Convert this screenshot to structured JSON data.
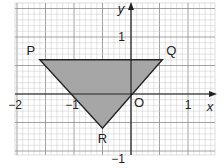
{
  "diagram": {
    "type": "coordinate-grid-triangle",
    "axes": {
      "x_label": "x",
      "y_label": "y",
      "origin_label": "O",
      "x_ticks": [
        {
          "value": -2,
          "label": "−2"
        },
        {
          "value": -1,
          "label": "−1"
        },
        {
          "value": 1,
          "label": "1"
        }
      ],
      "y_ticks": [
        {
          "value": 1,
          "label": "1"
        },
        {
          "value": -1,
          "label": "−1"
        }
      ],
      "x_range": [
        -2.05,
        1.5
      ],
      "y_range": [
        -1.05,
        1.6
      ]
    },
    "grid": {
      "minor_step": 0.1,
      "major_step": 0.5
    },
    "triangle": {
      "fill": "#a6a6a6",
      "stroke": "#222222",
      "vertices": [
        {
          "label": "P",
          "x": -1.6,
          "y": 0.6
        },
        {
          "label": "Q",
          "x": 0.55,
          "y": 0.6
        },
        {
          "label": "R",
          "x": -0.5,
          "y": -0.6
        }
      ]
    },
    "colors": {
      "minor_grid": "#c8c8c8",
      "major_grid": "#8a8a8a",
      "axis": "#222222"
    }
  }
}
